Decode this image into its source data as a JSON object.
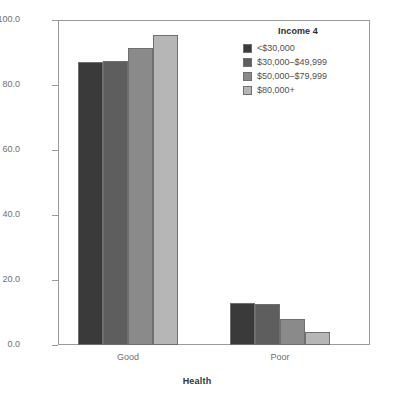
{
  "chart_data": {
    "type": "bar",
    "title": "",
    "xlabel": "Health",
    "ylabel": "Percentage",
    "categories": [
      "Good",
      "Poor"
    ],
    "ylim": [
      0.0,
      100.0
    ],
    "yticks": [
      "0.0",
      "20.0",
      "40.0",
      "60.0",
      "80.0",
      "100.0"
    ],
    "ytick_values": [
      0.0,
      20.0,
      40.0,
      60.0,
      80.0,
      100.0
    ],
    "grid": false,
    "legend_position": "top-right",
    "legend_title": "Income 4",
    "series": [
      {
        "name": "<$30,000",
        "color": "#3a3a3a",
        "values": [
          87.0,
          13.0
        ]
      },
      {
        "name": "$30,000–$49,999",
        "color": "#5e5e5e",
        "values": [
          87.5,
          12.5
        ]
      },
      {
        "name": "$50,000–$79,999",
        "color": "#8a8a8a",
        "values": [
          91.5,
          8.0
        ]
      },
      {
        "name": "$80,000+",
        "color": "#b6b6b6",
        "values": [
          95.5,
          4.0
        ]
      }
    ]
  },
  "axes": {
    "y_title": "Percentage",
    "x_title": "Health"
  },
  "legend": {
    "title": "Income 4"
  },
  "colors": {
    "frame": "#9a9a9a",
    "tick_text": "#707070",
    "axis_title": "#333333",
    "bar_outline": "#6f6f6f"
  }
}
